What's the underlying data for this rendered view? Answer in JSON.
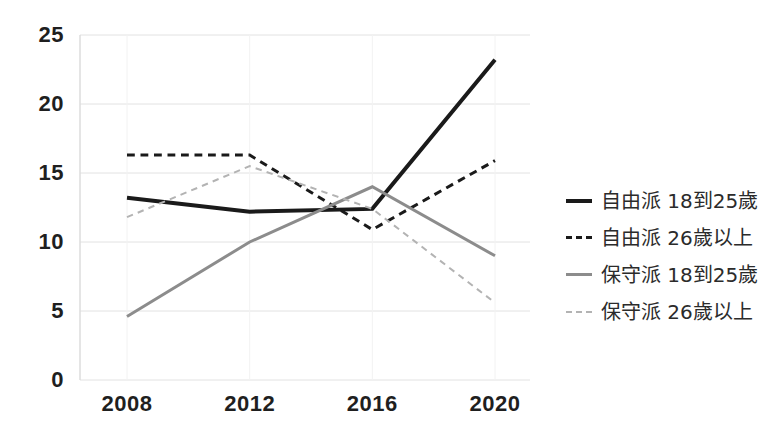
{
  "chart_data": {
    "type": "line",
    "title": "",
    "xlabel": "",
    "ylabel": "",
    "categories": [
      "2008",
      "2012",
      "2016",
      "2020"
    ],
    "x": [
      2008,
      2012,
      2016,
      2020
    ],
    "ylim": [
      0,
      25
    ],
    "xlim": [
      2008,
      2020
    ],
    "yticks": [
      "0",
      "5",
      "10",
      "15",
      "20",
      "25"
    ],
    "ytick_values": [
      0,
      5,
      10,
      15,
      20,
      25
    ],
    "grid": true,
    "grid_axis": "y",
    "legend_position": "right",
    "series": [
      {
        "name": "自由派 18到25歲",
        "values": [
          13.2,
          12.2,
          12.4,
          23.2
        ],
        "color": "#1a1a1a",
        "style": "solid",
        "width": 4
      },
      {
        "name": "自由派 26歲以上",
        "values": [
          16.3,
          16.3,
          10.9,
          15.9
        ],
        "color": "#1a1a1a",
        "style": "dashed",
        "width": 3
      },
      {
        "name": "保守派 18到25歲",
        "values": [
          4.6,
          10.0,
          14.0,
          9.0
        ],
        "color": "#8c8c8c",
        "style": "solid",
        "width": 3
      },
      {
        "name": "保守派 26歲以上",
        "values": [
          11.8,
          15.5,
          12.4,
          5.6
        ],
        "color": "#b3b3b3",
        "style": "dotted",
        "width": 2
      }
    ]
  },
  "axes": {
    "y_labels": [
      "25",
      "20",
      "15",
      "10",
      "5",
      "0"
    ],
    "x_labels": [
      "2008",
      "2012",
      "2016",
      "2020"
    ]
  },
  "legend": {
    "items": [
      {
        "label": "自由派 18到25歲",
        "swatch": "solid-thick-black"
      },
      {
        "label": "自由派 26歲以上",
        "swatch": "dashed-black"
      },
      {
        "label": "保守派 18到25歲",
        "swatch": "solid-gray"
      },
      {
        "label": "保守派 26歲以上",
        "swatch": "dotted-gray"
      }
    ]
  },
  "colors": {
    "background": "#ffffff",
    "axis_text": "#1f1f1f",
    "gridline": "#e2e2e2",
    "series_liberal_young": "#1a1a1a",
    "series_liberal_older": "#1a1a1a",
    "series_conservative_young": "#8c8c8c",
    "series_conservative_older": "#b3b3b3"
  }
}
